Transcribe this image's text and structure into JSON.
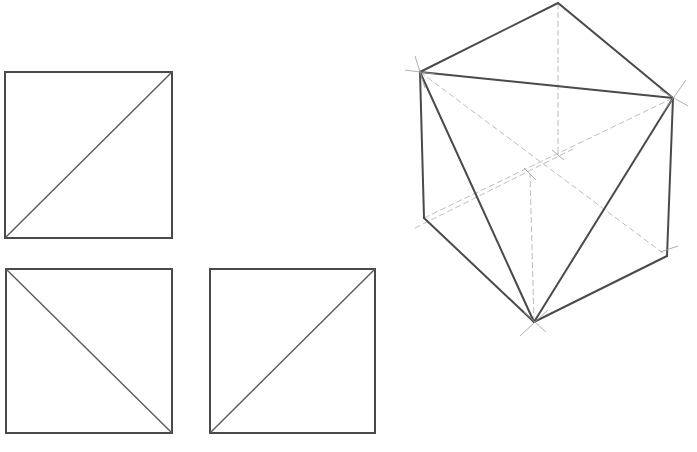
{
  "colors": {
    "stroke": "#4a4a4a",
    "diagonal": "#5a5a5a",
    "construction": "#b5b5b5",
    "background": "#ffffff"
  },
  "views": [
    {
      "name": "square-top-left",
      "x": 5,
      "y": 72,
      "w": 167,
      "h": 166,
      "diagonal": "bottom-left-to-top-right"
    },
    {
      "name": "square-bottom-left",
      "x": 6,
      "y": 269,
      "w": 166,
      "h": 164,
      "diagonal": "top-left-to-bottom-right"
    },
    {
      "name": "square-bottom-right",
      "x": 210,
      "y": 269,
      "w": 165,
      "h": 164,
      "diagonal": "bottom-left-to-top-right"
    }
  ],
  "cube": {
    "vertices": {
      "top": [
        558,
        3
      ],
      "upper_left": [
        420,
        72
      ],
      "upper_right": [
        673,
        98
      ],
      "lower_left": [
        424,
        218
      ],
      "lower_right": [
        667,
        256
      ],
      "bottom": [
        534,
        322
      ],
      "center_a": [
        530,
        174
      ],
      "center_b": [
        558,
        155
      ]
    }
  }
}
